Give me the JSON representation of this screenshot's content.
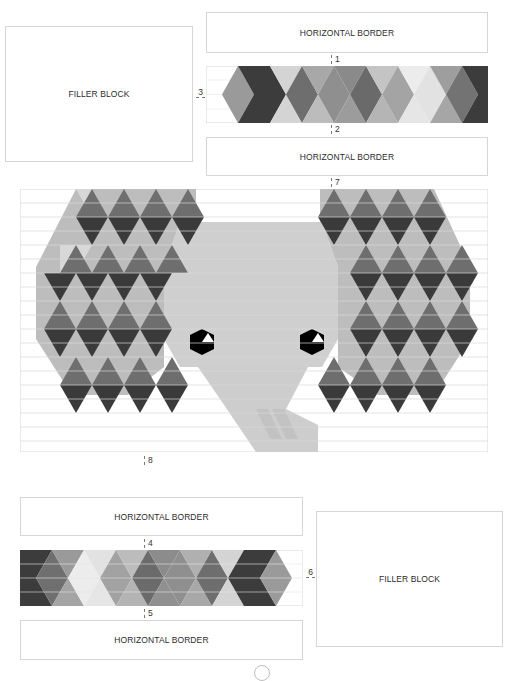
{
  "top_left_filler": {
    "label": "FILLER BLOCK"
  },
  "top_border_1": {
    "label": "HORIZONTAL BORDER"
  },
  "top_border_2": {
    "label": "HORIZONTAL BORDER"
  },
  "bottom_border_1": {
    "label": "HORIZONTAL BORDER"
  },
  "bottom_border_2": {
    "label": "HORIZONTAL BORDER"
  },
  "bottom_right_filler": {
    "label": "FILLER BLOCK"
  },
  "markers": {
    "m1": "1",
    "m2": "2",
    "m3": "3",
    "m4": "4",
    "m5": "5",
    "m6": "6",
    "m7": "7",
    "m8": "8"
  },
  "colors": {
    "dark": "#3c3c3c",
    "mid_dark": "#6e6e6e",
    "mid": "#8f8f8f",
    "light": "#bdbdbd",
    "lighter": "#d9d9d9",
    "face": "#cfcfcf",
    "eye": "#000000",
    "stripe": "#d0d0d0"
  },
  "main_panel": {
    "subject": "elephant-quilt-pattern"
  }
}
